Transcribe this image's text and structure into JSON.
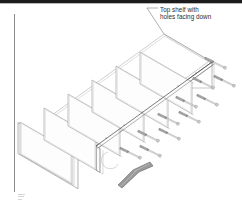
{
  "page": {
    "background_color": "#ffffff",
    "line_color": "#6e6e6e",
    "dark_line_color": "#3a3a3a",
    "panel_fill": "#fdfdfd",
    "hardware_color": "#7d7d7d",
    "header_band_color": "#1c1c1c",
    "text_color": "#2b2b2b"
  },
  "callout": {
    "line1": "Top shelf with",
    "line2": "holes facing down",
    "leader_from": "text-left",
    "leader_to": "top-shelf-panel"
  },
  "diagram": {
    "title_alt": "Isometric exploded assembly drawing of a shelf unit",
    "type": "line-drawing",
    "dividers_count": 6,
    "screws_count": 11,
    "tools": [
      {
        "name": "allen-wrench",
        "shape": "L-hex-key",
        "count": 1
      }
    ],
    "parts": [
      {
        "name": "top-shelf",
        "label": "Top shelf with holes facing down"
      },
      {
        "name": "divider-panel",
        "count": 6
      },
      {
        "name": "side-rail",
        "count": 2
      },
      {
        "name": "machine-screw",
        "count": 11
      }
    ]
  },
  "panels": [
    {
      "id": "divider-1",
      "x": 20,
      "y": 122
    },
    {
      "id": "divider-2",
      "x": 45,
      "y": 107
    },
    {
      "id": "divider-3",
      "x": 70,
      "y": 92
    },
    {
      "id": "divider-4",
      "x": 95,
      "y": 77
    },
    {
      "id": "divider-5",
      "x": 118,
      "y": 62
    },
    {
      "id": "divider-6",
      "x": 140,
      "y": 47
    }
  ],
  "screws": [
    {
      "id": "screw-1",
      "x": 205,
      "y": 58
    },
    {
      "id": "screw-2",
      "x": 193,
      "y": 78
    },
    {
      "id": "screw-3",
      "x": 214,
      "y": 76
    },
    {
      "id": "screw-4",
      "x": 176,
      "y": 97
    },
    {
      "id": "screw-5",
      "x": 197,
      "y": 95
    },
    {
      "id": "screw-6",
      "x": 158,
      "y": 114
    },
    {
      "id": "screw-7",
      "x": 179,
      "y": 112
    },
    {
      "id": "screw-8",
      "x": 138,
      "y": 131
    },
    {
      "id": "screw-9",
      "x": 159,
      "y": 129
    },
    {
      "id": "screw-10",
      "x": 120,
      "y": 148
    },
    {
      "id": "screw-11",
      "x": 140,
      "y": 146
    }
  ]
}
